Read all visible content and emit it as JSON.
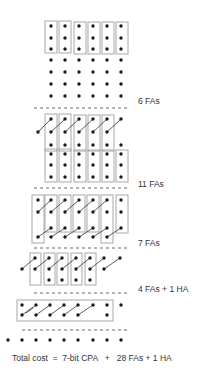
{
  "diagram": {
    "colors": {
      "dot": "#1a1a1a",
      "box": "#a8a8a8",
      "dash": "#444444",
      "carry_line": "#333333",
      "text": "#333333"
    }
  },
  "stages": [
    {
      "id": "initial",
      "label": "",
      "dots": {
        "xs": [
          51,
          65,
          79,
          93,
          107,
          121
        ],
        "ys": [
          26,
          38,
          49,
          60,
          72,
          84,
          96
        ]
      },
      "boxes": [
        {
          "x": 45,
          "y": 21,
          "w": 12,
          "h": 32
        },
        {
          "x": 59,
          "y": 21,
          "w": 12,
          "h": 32
        },
        {
          "x": 74,
          "y": 22,
          "w": 12,
          "h": 32
        },
        {
          "x": 88,
          "y": 22,
          "w": 12,
          "h": 32
        },
        {
          "x": 102,
          "y": 22,
          "w": 12,
          "h": 32
        },
        {
          "x": 116,
          "y": 22,
          "w": 12,
          "h": 32
        }
      ],
      "carries": []
    },
    {
      "id": "after-6-fas",
      "label": "6 FAs",
      "dash_y": 108,
      "label_pos": {
        "x": 138,
        "y": 101
      },
      "dot_list": [
        [
          51,
          119
        ],
        [
          65,
          119
        ],
        [
          79,
          119
        ],
        [
          93,
          119
        ],
        [
          107,
          119
        ],
        [
          121,
          119
        ],
        [
          38,
          132
        ],
        [
          51,
          132
        ],
        [
          65,
          132
        ],
        [
          79,
          132
        ],
        [
          93,
          132
        ],
        [
          107,
          132
        ],
        [
          51,
          145
        ],
        [
          65,
          145
        ],
        [
          79,
          145
        ],
        [
          93,
          145
        ],
        [
          107,
          145
        ],
        [
          121,
          145
        ],
        [
          51,
          154
        ],
        [
          65,
          154
        ],
        [
          79,
          154
        ],
        [
          93,
          154
        ],
        [
          107,
          154
        ],
        [
          121,
          154
        ],
        [
          51,
          165
        ],
        [
          65,
          165
        ],
        [
          79,
          165
        ],
        [
          93,
          165
        ],
        [
          107,
          165
        ],
        [
          121,
          165
        ],
        [
          51,
          177
        ],
        [
          65,
          177
        ],
        [
          79,
          177
        ],
        [
          93,
          177
        ],
        [
          107,
          177
        ],
        [
          121,
          177
        ]
      ],
      "boxes": [
        {
          "x": 45,
          "y": 114,
          "w": 12,
          "h": 37
        },
        {
          "x": 59,
          "y": 114,
          "w": 12,
          "h": 37
        },
        {
          "x": 74,
          "y": 115,
          "w": 12,
          "h": 36
        },
        {
          "x": 88,
          "y": 115,
          "w": 12,
          "h": 36
        },
        {
          "x": 102,
          "y": 115,
          "w": 12,
          "h": 36
        },
        {
          "x": 45,
          "y": 149,
          "w": 12,
          "h": 33
        },
        {
          "x": 59,
          "y": 149,
          "w": 12,
          "h": 33
        },
        {
          "x": 74,
          "y": 150,
          "w": 12,
          "h": 32
        },
        {
          "x": 88,
          "y": 150,
          "w": 12,
          "h": 32
        },
        {
          "x": 102,
          "y": 150,
          "w": 12,
          "h": 32
        },
        {
          "x": 116,
          "y": 150,
          "w": 12,
          "h": 32
        }
      ],
      "carries": [
        [
          [
            38,
            132
          ],
          [
            51,
            119
          ]
        ],
        [
          [
            51,
            132
          ],
          [
            65,
            119
          ]
        ],
        [
          [
            65,
            132
          ],
          [
            79,
            119
          ]
        ],
        [
          [
            79,
            132
          ],
          [
            93,
            119
          ]
        ],
        [
          [
            93,
            132
          ],
          [
            107,
            119
          ]
        ],
        [
          [
            107,
            132
          ],
          [
            121,
            119
          ]
        ]
      ]
    },
    {
      "id": "after-11-fas",
      "label": "11 FAs",
      "dash_y": 188,
      "label_pos": {
        "x": 138,
        "y": 184
      },
      "dot_list": [
        [
          38,
          200
        ],
        [
          51,
          200
        ],
        [
          65,
          200
        ],
        [
          79,
          200
        ],
        [
          93,
          200
        ],
        [
          107,
          200
        ],
        [
          121,
          200
        ],
        [
          38,
          212
        ],
        [
          51,
          212
        ],
        [
          65,
          212
        ],
        [
          79,
          212
        ],
        [
          93,
          212
        ],
        [
          107,
          212
        ],
        [
          121,
          212
        ],
        [
          51,
          228
        ],
        [
          65,
          228
        ],
        [
          79,
          228
        ],
        [
          93,
          228
        ],
        [
          107,
          228
        ],
        [
          121,
          228
        ],
        [
          38,
          237
        ],
        [
          51,
          237
        ],
        [
          65,
          237
        ],
        [
          79,
          237
        ],
        [
          93,
          237
        ],
        [
          107,
          237
        ]
      ],
      "boxes": [
        {
          "x": 32,
          "y": 195,
          "w": 12,
          "h": 48
        },
        {
          "x": 45,
          "y": 195,
          "w": 12,
          "h": 37
        },
        {
          "x": 59,
          "y": 195,
          "w": 12,
          "h": 37
        },
        {
          "x": 73,
          "y": 195,
          "w": 12,
          "h": 37
        },
        {
          "x": 87,
          "y": 195,
          "w": 12,
          "h": 37
        },
        {
          "x": 101,
          "y": 195,
          "w": 12,
          "h": 48
        },
        {
          "x": 116,
          "y": 195,
          "w": 12,
          "h": 38
        }
      ],
      "carries": [
        [
          [
            38,
            212
          ],
          [
            51,
            200
          ]
        ],
        [
          [
            51,
            212
          ],
          [
            65,
            200
          ]
        ],
        [
          [
            65,
            212
          ],
          [
            79,
            200
          ]
        ],
        [
          [
            79,
            212
          ],
          [
            93,
            200
          ]
        ],
        [
          [
            93,
            212
          ],
          [
            107,
            200
          ]
        ],
        [
          [
            38,
            237
          ],
          [
            51,
            228
          ]
        ],
        [
          [
            51,
            237
          ],
          [
            65,
            228
          ]
        ],
        [
          [
            65,
            237
          ],
          [
            79,
            228
          ]
        ],
        [
          [
            79,
            237
          ],
          [
            93,
            228
          ]
        ],
        [
          [
            93,
            237
          ],
          [
            107,
            228
          ]
        ],
        [
          [
            107,
            237
          ],
          [
            121,
            228
          ]
        ]
      ]
    },
    {
      "id": "after-7-fas",
      "label": "7 FAs",
      "dash_y": 248,
      "label_pos": {
        "x": 138,
        "y": 243
      },
      "dot_list": [
        [
          35,
          258
        ],
        [
          49,
          258
        ],
        [
          62,
          258
        ],
        [
          76,
          258
        ],
        [
          90,
          258
        ],
        [
          104,
          258
        ],
        [
          120,
          258
        ],
        [
          22,
          269
        ],
        [
          35,
          269
        ],
        [
          49,
          269
        ],
        [
          62,
          269
        ],
        [
          76,
          269
        ],
        [
          90,
          269
        ],
        [
          104,
          269
        ],
        [
          49,
          280
        ],
        [
          62,
          280
        ],
        [
          76,
          280
        ],
        [
          90,
          280
        ]
      ],
      "boxes": [
        {
          "x": 30,
          "y": 253,
          "w": 11,
          "h": 32
        },
        {
          "x": 44,
          "y": 253,
          "w": 11,
          "h": 32
        },
        {
          "x": 57,
          "y": 253,
          "w": 11,
          "h": 32
        },
        {
          "x": 71,
          "y": 253,
          "w": 11,
          "h": 32
        },
        {
          "x": 85,
          "y": 253,
          "w": 11,
          "h": 32
        }
      ],
      "carries": [
        [
          [
            22,
            269
          ],
          [
            35,
            258
          ]
        ],
        [
          [
            35,
            269
          ],
          [
            49,
            258
          ]
        ],
        [
          [
            49,
            269
          ],
          [
            62,
            258
          ]
        ],
        [
          [
            62,
            269
          ],
          [
            76,
            258
          ]
        ],
        [
          [
            76,
            269
          ],
          [
            90,
            258
          ]
        ],
        [
          [
            90,
            269
          ],
          [
            104,
            258
          ]
        ],
        [
          [
            104,
            269
          ],
          [
            120,
            258
          ]
        ]
      ]
    },
    {
      "id": "after-4fas-1ha",
      "label": "4 FAs + 1 HA",
      "dash_y": 293,
      "label_pos": {
        "x": 138,
        "y": 289
      },
      "dot_list": [
        [
          22,
          305
        ],
        [
          36,
          305
        ],
        [
          50,
          305
        ],
        [
          64,
          305
        ],
        [
          78,
          305
        ],
        [
          93,
          305
        ],
        [
          107,
          305
        ],
        [
          121,
          305
        ],
        [
          22,
          315
        ],
        [
          36,
          315
        ],
        [
          50,
          315
        ],
        [
          64,
          315
        ],
        [
          78,
          315
        ],
        [
          107,
          315
        ]
      ],
      "boxes": [
        {
          "x": 17,
          "y": 300,
          "w": 96,
          "h": 21
        }
      ],
      "carries": [
        [
          [
            22,
            315
          ],
          [
            36,
            305
          ]
        ],
        [
          [
            36,
            315
          ],
          [
            50,
            305
          ]
        ],
        [
          [
            50,
            315
          ],
          [
            64,
            305
          ]
        ],
        [
          [
            64,
            315
          ],
          [
            78,
            305
          ]
        ],
        [
          [
            78,
            315
          ],
          [
            93,
            305
          ]
        ]
      ],
      "ha_cross": [
        [
          26,
          305
        ],
        [
          33,
          315
        ]
      ]
    },
    {
      "id": "final",
      "label": "",
      "dash_y": 330,
      "dot_list": [
        [
          8,
          340
        ],
        [
          22,
          340
        ],
        [
          36,
          340
        ],
        [
          50,
          340
        ],
        [
          64,
          340
        ],
        [
          78,
          340
        ],
        [
          93,
          340
        ],
        [
          107,
          340
        ],
        [
          121,
          340
        ]
      ],
      "boxes": [],
      "carries": []
    }
  ],
  "dashes": {
    "x_start": 34,
    "x_end": 128,
    "final_x_start": 22
  },
  "summary": {
    "total_cost_label": "Total cost  =  7-bit CPA   +   28 FAs + 1 HA"
  },
  "labels": {
    "stage_6fas": "6 FAs",
    "stage_11fas": "11 FAs",
    "stage_7fas": "7 FAs",
    "stage_4fas_1ha": "4 FAs + 1 HA"
  }
}
